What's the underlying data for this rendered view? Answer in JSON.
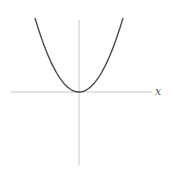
{
  "chart_data": {
    "type": "line",
    "title": "",
    "xlabel": "x",
    "ylabel": "",
    "function": "y = x^2",
    "grid": false,
    "legend": null,
    "xlim": [
      -1.5,
      1.5
    ],
    "ylim": [
      -1.3,
      1.4
    ],
    "series": [
      {
        "name": "x^2",
        "x": [
          -1.0,
          -0.75,
          -0.5,
          -0.25,
          0.0,
          0.25,
          0.5,
          0.75,
          1.0
        ],
        "values": [
          1.0,
          0.5625,
          0.25,
          0.0625,
          0.0,
          0.0625,
          0.25,
          0.5625,
          1.0
        ]
      }
    ],
    "colors": {
      "curve": "#4a4a4a",
      "axes": "#c8c8c8",
      "label": "#555555"
    }
  },
  "labels": {
    "x_axis": "x"
  }
}
